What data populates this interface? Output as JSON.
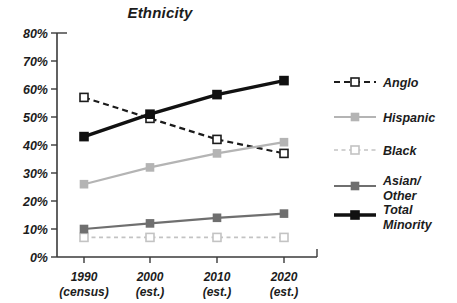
{
  "chart_data": {
    "type": "line",
    "title": "Ethnicity",
    "xlabel": "",
    "ylabel": "",
    "ylim": [
      0,
      80
    ],
    "ytick_labels": [
      "0%",
      "10%",
      "20%",
      "30%",
      "40%",
      "50%",
      "60%",
      "70%",
      "80%"
    ],
    "ytick_values": [
      0,
      10,
      20,
      30,
      40,
      50,
      60,
      70,
      80
    ],
    "grid": false,
    "legend_position": "right",
    "categories": [
      "1990",
      "2000",
      "2010",
      "2020"
    ],
    "category_sublabels": [
      "(census)",
      "(est.)",
      "(est.)",
      "(est.)"
    ],
    "series": [
      {
        "name": "Anglo",
        "values": [
          57,
          49.5,
          42,
          37
        ],
        "color": "#1c1c1c",
        "line_style": "dashed",
        "marker": "open-square",
        "line_width": 2.2
      },
      {
        "name": "Hispanic",
        "values": [
          26,
          32,
          37,
          41
        ],
        "color": "#b4b4b4",
        "line_style": "solid",
        "marker": "filled-square",
        "line_width": 2.2
      },
      {
        "name": "Black",
        "values": [
          7,
          7,
          7,
          7
        ],
        "color": "#c3c3c3",
        "line_style": "dashed",
        "marker": "open-square",
        "line_width": 1.6
      },
      {
        "name": "Asian/ Other",
        "values": [
          10,
          12,
          14,
          15.5
        ],
        "color": "#6f6f6f",
        "line_style": "solid",
        "marker": "filled-square",
        "line_width": 2.2
      },
      {
        "name": "Total Minority",
        "values": [
          43,
          51,
          58,
          63
        ],
        "color": "#111111",
        "line_style": "solid",
        "marker": "filled-square",
        "line_width": 3.4
      }
    ]
  },
  "legend": {
    "entries": [
      {
        "label_line1": "Anglo",
        "label_line2": ""
      },
      {
        "label_line1": "Hispanic",
        "label_line2": ""
      },
      {
        "label_line1": "Black",
        "label_line2": ""
      },
      {
        "label_line1": "Asian/",
        "label_line2": "Other"
      },
      {
        "label_line1": "Total",
        "label_line2": "Minority"
      }
    ]
  }
}
